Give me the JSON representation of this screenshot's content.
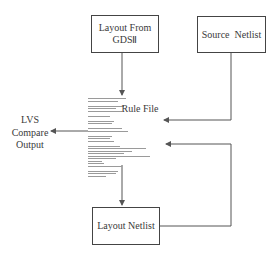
{
  "nodes": {
    "layout_gds": {
      "line1": "Layout From",
      "line2": "GDSⅡ"
    },
    "source_netlist": {
      "label": "Source  Netlist"
    },
    "rule_file": {
      "label": "Rule File"
    },
    "layout_netlist": {
      "label": "Layout Netlist"
    },
    "lvs_output": {
      "line1": "LVS",
      "line2": "Compare",
      "line3": "Output"
    }
  },
  "colors": {
    "line": "#555555",
    "box_border": "#444444",
    "text": "#3a3a3a"
  },
  "rule_file_code_lines": [
    38,
    30,
    0,
    36,
    28,
    34,
    0,
    22,
    0,
    26,
    24,
    0,
    34,
    40,
    0,
    24,
    22,
    26,
    0,
    32,
    58,
    44,
    36,
    62,
    28,
    14,
    16,
    34,
    0,
    30,
    28,
    18
  ]
}
